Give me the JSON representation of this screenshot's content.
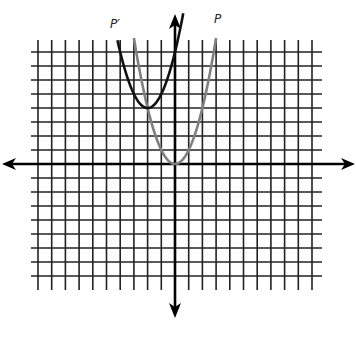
{
  "chart_data": {
    "type": "line",
    "title": "",
    "xlabel": "",
    "ylabel": "",
    "xlim": [
      -10,
      10
    ],
    "ylim": [
      -9,
      9
    ],
    "grid": true,
    "grid_step": 1,
    "axes_arrows": true,
    "series": [
      {
        "name": "P",
        "equation": "y = x^2",
        "vertex": [
          0,
          0
        ],
        "color": "#808080",
        "x_range": [
          -3,
          3
        ]
      },
      {
        "name": "P′",
        "equation": "y = (x + 2)^2 + 4",
        "vertex": [
          -2,
          4
        ],
        "color": "#111111",
        "x_range": [
          -4.2,
          0.6
        ]
      }
    ],
    "annotations": [
      {
        "text": "P′",
        "near_series": "P′",
        "position": "upper-left"
      },
      {
        "text": "P",
        "near_series": "P",
        "position": "upper-right"
      }
    ]
  },
  "labels": {
    "p_prime": "P′",
    "p": "P"
  }
}
